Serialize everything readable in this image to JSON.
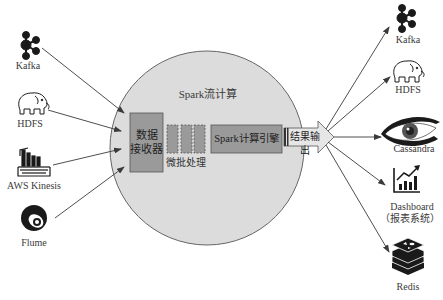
{
  "diagram": {
    "title": "Spark流计算",
    "colors": {
      "circle_fill": "#dcdcdc",
      "circle_stroke": "#666666",
      "box_fill": "#9a9a9a",
      "box_stroke": "#555555",
      "arrow": "#3a3a3a",
      "icon": "#1a1a1a"
    },
    "core": {
      "receiver": {
        "line1": "数据",
        "line2": "接收器"
      },
      "micro_batch": "微批处理",
      "engine": "Spark计算引擎",
      "output": "结果输出"
    },
    "sources": [
      {
        "label": "Kafka",
        "icon": "kafka-icon"
      },
      {
        "label": "HDFS",
        "icon": "hadoop-elephant-icon"
      },
      {
        "label": "AWS Kinesis",
        "icon": "aws-kinesis-icon"
      },
      {
        "label": "Flume",
        "icon": "flume-icon"
      }
    ],
    "sinks": [
      {
        "label": "Kafka",
        "icon": "kafka-icon"
      },
      {
        "label": "HDFS",
        "icon": "hadoop-elephant-icon"
      },
      {
        "label": "Cassandra",
        "icon": "cassandra-eye-icon"
      },
      {
        "label": "Dashboard",
        "sublabel": "（报表系统）",
        "icon": "dashboard-chart-icon"
      },
      {
        "label": "Redis",
        "icon": "redis-icon"
      }
    ]
  }
}
